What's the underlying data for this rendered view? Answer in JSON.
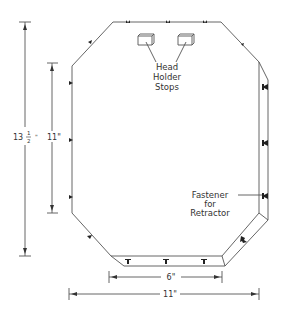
{
  "diagram": {
    "stroke_color": "#555555",
    "text_color": "#333333",
    "labels": {
      "head_holder_stops": [
        "Head",
        "Holder",
        "Stops"
      ],
      "fastener": [
        "Fastener",
        "for",
        "Retractor"
      ]
    },
    "dimensions": {
      "overall_height": {
        "whole": "13",
        "frac_num": "1",
        "frac_den": "2",
        "unit": "\""
      },
      "side_height": {
        "value": "11\""
      },
      "bottom_width": {
        "value": "6\""
      },
      "overall_width": {
        "value": "11\""
      }
    },
    "components": {
      "head_holder_stops_count": 2,
      "fastener_markers": 14
    }
  }
}
